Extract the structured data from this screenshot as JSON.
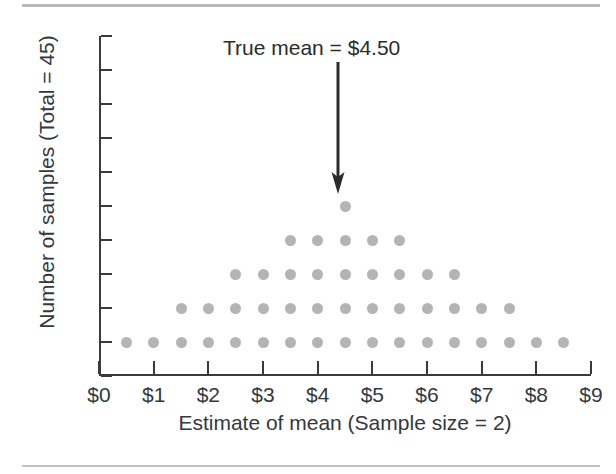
{
  "chart_data": {
    "type": "scatter",
    "subtype": "dot-plot",
    "title": "",
    "xlabel": "Estimate of mean (Sample size = 2)",
    "ylabel": "Number of samples (Total = 45)",
    "xlim": [
      0,
      9
    ],
    "ylim": [
      0,
      10
    ],
    "grid": false,
    "legend": null,
    "x_tick_labels": [
      "$0",
      "$1",
      "$2",
      "$3",
      "$4",
      "$5",
      "$6",
      "$7",
      "$8",
      "$9"
    ],
    "x_tick_values": [
      0,
      1,
      2,
      3,
      4,
      5,
      6,
      7,
      8,
      9
    ],
    "y_tick_labels": [
      "0",
      "1",
      "2",
      "3",
      "4",
      "5",
      "6",
      "7",
      "8",
      "9",
      "10"
    ],
    "y_tick_values": [
      0,
      1,
      2,
      3,
      4,
      5,
      6,
      7,
      8,
      9,
      10
    ],
    "dot_color": "#b4b4b4",
    "axis_color": "#3a3a3a",
    "total_samples": 45,
    "x": [
      0.5,
      1.0,
      1.5,
      2.0,
      2.5,
      3.0,
      3.5,
      4.0,
      4.5,
      5.0,
      5.5,
      6.0,
      6.5,
      7.0,
      7.5,
      8.0,
      8.5
    ],
    "values": [
      1,
      1,
      2,
      2,
      3,
      3,
      4,
      4,
      5,
      4,
      4,
      3,
      3,
      2,
      2,
      1,
      1
    ],
    "points": [
      {
        "x": 0.5,
        "y": 1
      },
      {
        "x": 1.0,
        "y": 1
      },
      {
        "x": 1.5,
        "y": 1
      },
      {
        "x": 1.5,
        "y": 2
      },
      {
        "x": 2.0,
        "y": 1
      },
      {
        "x": 2.0,
        "y": 2
      },
      {
        "x": 2.5,
        "y": 1
      },
      {
        "x": 2.5,
        "y": 2
      },
      {
        "x": 2.5,
        "y": 3
      },
      {
        "x": 3.0,
        "y": 1
      },
      {
        "x": 3.0,
        "y": 2
      },
      {
        "x": 3.0,
        "y": 3
      },
      {
        "x": 3.5,
        "y": 1
      },
      {
        "x": 3.5,
        "y": 2
      },
      {
        "x": 3.5,
        "y": 3
      },
      {
        "x": 3.5,
        "y": 4
      },
      {
        "x": 4.0,
        "y": 1
      },
      {
        "x": 4.0,
        "y": 2
      },
      {
        "x": 4.0,
        "y": 3
      },
      {
        "x": 4.0,
        "y": 4
      },
      {
        "x": 4.5,
        "y": 1
      },
      {
        "x": 4.5,
        "y": 2
      },
      {
        "x": 4.5,
        "y": 3
      },
      {
        "x": 4.5,
        "y": 4
      },
      {
        "x": 4.5,
        "y": 5
      },
      {
        "x": 5.0,
        "y": 1
      },
      {
        "x": 5.0,
        "y": 2
      },
      {
        "x": 5.0,
        "y": 3
      },
      {
        "x": 5.0,
        "y": 4
      },
      {
        "x": 5.5,
        "y": 1
      },
      {
        "x": 5.5,
        "y": 2
      },
      {
        "x": 5.5,
        "y": 3
      },
      {
        "x": 5.5,
        "y": 4
      },
      {
        "x": 6.0,
        "y": 1
      },
      {
        "x": 6.0,
        "y": 2
      },
      {
        "x": 6.0,
        "y": 3
      },
      {
        "x": 6.5,
        "y": 1
      },
      {
        "x": 6.5,
        "y": 2
      },
      {
        "x": 6.5,
        "y": 3
      },
      {
        "x": 7.0,
        "y": 1
      },
      {
        "x": 7.0,
        "y": 2
      },
      {
        "x": 7.5,
        "y": 1
      },
      {
        "x": 7.5,
        "y": 2
      },
      {
        "x": 8.0,
        "y": 1
      },
      {
        "x": 8.5,
        "y": 1
      }
    ],
    "annotations": [
      {
        "text": "True mean = $4.50",
        "x": 4.5,
        "points_to_y": 5.8,
        "arrow": "down-arrow"
      }
    ]
  },
  "annotation": {
    "label": "True mean = $4.50"
  }
}
